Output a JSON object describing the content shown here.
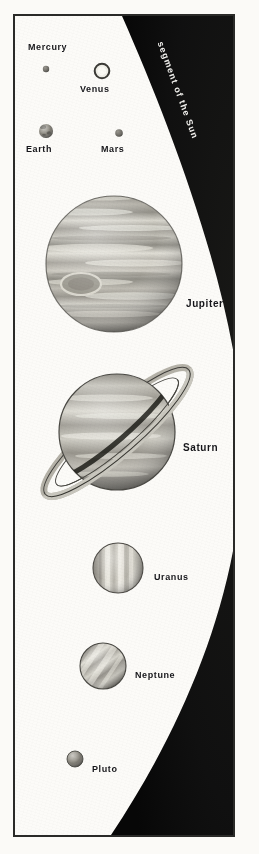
{
  "figure": {
    "background_color": "#fbfaf7",
    "frame_color": "#2a2a28",
    "sun_color": "#0d0d0c"
  },
  "sun": {
    "label": "segment of the Sun",
    "label_color": "#f2f1ee"
  },
  "planets": [
    {
      "name": "Mercury",
      "label": "Mercury",
      "cx": 44,
      "cy": 67,
      "r": 3.2,
      "color": "#6b6b6b",
      "label_x": 26,
      "label_y": 40,
      "font_size": 9,
      "type": "dot"
    },
    {
      "name": "Venus",
      "label": "Venus",
      "cx": 100,
      "cy": 69,
      "r": 7.5,
      "color": "#eceae2",
      "label_x": 78,
      "label_y": 82,
      "font_size": 9,
      "type": "ring"
    },
    {
      "name": "Earth",
      "label": "Earth",
      "cx": 44,
      "cy": 129,
      "r": 7.0,
      "color": "#8e8e8e",
      "label_x": 24,
      "label_y": 142,
      "font_size": 9,
      "type": "mottled"
    },
    {
      "name": "Mars",
      "label": "Mars",
      "cx": 117,
      "cy": 131,
      "r": 3.8,
      "color": "#5f5f5f",
      "label_x": 99,
      "label_y": 142,
      "font_size": 9,
      "type": "dot"
    },
    {
      "name": "Jupiter",
      "label": "Jupiter",
      "cx": 112,
      "cy": 262,
      "r": 68,
      "color": "#a8a59c",
      "label_x": 184,
      "label_y": 296,
      "font_size": 10,
      "type": "banded"
    },
    {
      "name": "Saturn",
      "label": "Saturn",
      "cx": 115,
      "cy": 430,
      "r": 58,
      "color": "#a9a69d",
      "label_x": 181,
      "label_y": 440,
      "font_size": 10,
      "type": "ringed"
    },
    {
      "name": "Uranus",
      "label": "Uranus",
      "cx": 116,
      "cy": 566,
      "r": 25,
      "color": "#b0ada3",
      "label_x": 152,
      "label_y": 570,
      "font_size": 9,
      "type": "vertical-banded"
    },
    {
      "name": "Neptune",
      "label": "Neptune",
      "cx": 101,
      "cy": 664,
      "r": 23,
      "color": "#9d9a91",
      "label_x": 133,
      "label_y": 668,
      "font_size": 9,
      "type": "diagonal-banded"
    },
    {
      "name": "Pluto",
      "label": "Pluto",
      "cx": 73,
      "cy": 757,
      "r": 8,
      "color": "#77746d",
      "label_x": 90,
      "label_y": 762,
      "font_size": 9,
      "type": "small"
    }
  ]
}
